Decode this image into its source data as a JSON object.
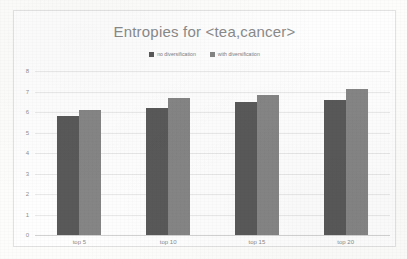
{
  "chart_data": {
    "type": "bar",
    "title": "Entropies for <tea,cancer>",
    "xlabel": "",
    "ylabel": "",
    "categories": [
      "top 5",
      "top 10",
      "top 15",
      "top 20"
    ],
    "series": [
      {
        "name": "no diversification",
        "color": "#595959",
        "values": [
          5.8,
          6.2,
          6.5,
          6.6
        ]
      },
      {
        "name": "with diversification",
        "color": "#858585",
        "values": [
          6.1,
          6.7,
          6.85,
          7.1
        ]
      }
    ],
    "ylim": [
      0,
      8
    ],
    "yticks": [
      0,
      1,
      2,
      3,
      4,
      5,
      6,
      7,
      8
    ],
    "ytick_labels": [
      "0",
      "1",
      "2",
      "3",
      "4",
      "5",
      "6",
      "7",
      "8"
    ],
    "grid": true,
    "legend_position": "top-center"
  }
}
